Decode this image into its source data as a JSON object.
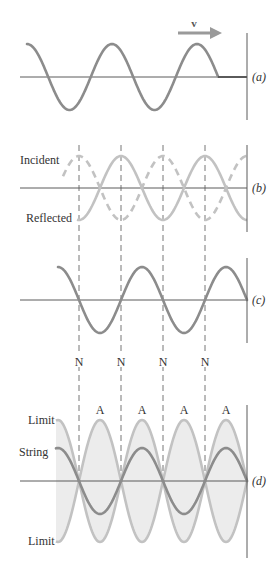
{
  "figure": {
    "colors": {
      "wave_dark": "#8c8c8c",
      "wave_light": "#c2c2c2",
      "fill": "#ececec",
      "axis": "#5a5a5a",
      "wall": "#5a5a5a",
      "dash": "#777777",
      "text": "#333333",
      "arrow": "#9a9a9a"
    },
    "wavelength_px": 84,
    "nodes_x": [
      79,
      121,
      163,
      205
    ],
    "wall_x": 247
  },
  "panels": {
    "a": {
      "label": "(a)",
      "velocity_label": "v",
      "axis_y": 77
    },
    "b": {
      "label": "(b)",
      "incident_label": "Incident",
      "reflected_label": "Reflected",
      "axis_y": 188
    },
    "c": {
      "label": "(c)",
      "axis_y": 300,
      "node_labels": [
        "N",
        "N",
        "N",
        "N"
      ]
    },
    "d": {
      "label": "(d)",
      "axis_y": 481,
      "antinode_labels": [
        "A",
        "A",
        "A",
        "A"
      ],
      "limit_top_label": "Limit",
      "string_label": "String",
      "limit_bottom_label": "Limit"
    }
  }
}
